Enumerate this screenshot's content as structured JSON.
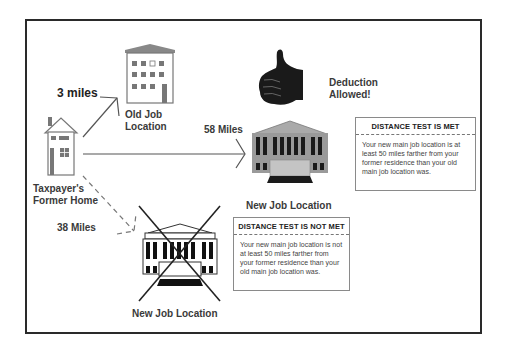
{
  "diagram": {
    "nodes": {
      "home": {
        "label_line1": "Taxpayer's",
        "label_line2": "Former Home"
      },
      "old_job": {
        "label_line1": "Old Job",
        "label_line2": "Location"
      },
      "new_job_met": {
        "label": "New Job Location"
      },
      "new_job_not_met": {
        "label": "New Job Location"
      },
      "deduction": {
        "label_line1": "Deduction",
        "label_line2": "Allowed!"
      }
    },
    "edges": [
      {
        "from": "home",
        "to": "old_job",
        "label": "3 miles",
        "style": "solid"
      },
      {
        "from": "home",
        "to": "new_job_met",
        "label": "58 Miles",
        "style": "solid"
      },
      {
        "from": "home",
        "to": "new_job_not_met",
        "label": "38 Miles",
        "style": "dashed"
      }
    ],
    "boxes": {
      "met": {
        "header": "DISTANCE TEST IS MET",
        "text": "Your new main job location is at least 50 miles farther from your former residence than your old main job location was."
      },
      "not_met": {
        "header": "DISTANCE TEST IS NOT MET",
        "text": "Your new main job location is not at least 50 miles farther from your former residence than your old main job location was."
      }
    },
    "icons": {
      "home": "house-icon",
      "old_job": "office-building-icon",
      "new_job": "courthouse-building-icon",
      "approval": "thumbs-up-icon",
      "rejection": "x-cross-icon"
    },
    "colors": {
      "frame": "#2a2a2a",
      "building_fill": "#9a9a9a",
      "window": "#555555",
      "text": "#333333"
    }
  }
}
